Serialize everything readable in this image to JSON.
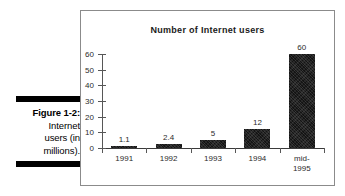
{
  "caption": {
    "figure_label": "Figure 1-2:",
    "lines": [
      "Internet",
      "users (in",
      "millions)."
    ]
  },
  "figure": {
    "title": "Number of Internet users"
  },
  "chart_data": {
    "type": "bar",
    "title": "Number of Internet users",
    "xlabel": "",
    "ylabel": "",
    "categories": [
      "1991",
      "1992",
      "1993",
      "1994",
      "mid-\n1995"
    ],
    "values": [
      1.1,
      2.4,
      5,
      12,
      60
    ],
    "value_labels": [
      "1.1",
      "2.4",
      "5",
      "12",
      "60"
    ],
    "ylim": [
      0,
      60
    ],
    "yticks": [
      0,
      10,
      20,
      30,
      40,
      50,
      60
    ],
    "ytick_labels": [
      "0",
      "10",
      "20",
      "30",
      "40",
      "50",
      "60"
    ],
    "grid": false,
    "legend": false,
    "bar_color": "#141414"
  }
}
